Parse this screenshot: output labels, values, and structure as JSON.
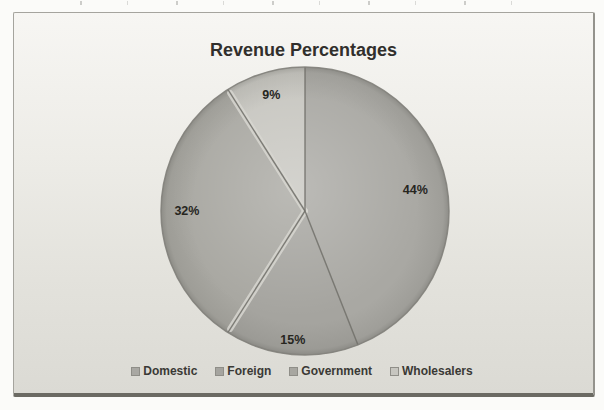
{
  "page": {
    "background": "#fbfbf9"
  },
  "chart_frame": {
    "background_top": "#f7f6f3",
    "background_bottom": "#dbdad4",
    "border_color": "#a5a49e",
    "bottom_edge_color": "#6b6a63"
  },
  "chart_data": {
    "type": "pie",
    "title": "Revenue Percentages",
    "categories": [
      "Domestic",
      "Foreign",
      "Government",
      "Wholesalers"
    ],
    "values": [
      44,
      15,
      32,
      9
    ],
    "labels": [
      "44%",
      "15%",
      "32%",
      "9%"
    ],
    "slice_colors": [
      "#a9a8a3",
      "#a5a49f",
      "#a8a7a1",
      "#c7c6c0"
    ],
    "label_color": "#27261f",
    "title_color": "#312f2c",
    "start_angle": 0,
    "direction": "clockwise",
    "legend_position": "bottom"
  },
  "legend": {
    "text_color": "#3a3935",
    "items": [
      {
        "label": "Domestic",
        "color": "#a9a8a3"
      },
      {
        "label": "Foreign",
        "color": "#a5a49f"
      },
      {
        "label": "Government",
        "color": "#a8a7a1"
      },
      {
        "label": "Wholesalers",
        "color": "#c7c6c0"
      }
    ]
  }
}
